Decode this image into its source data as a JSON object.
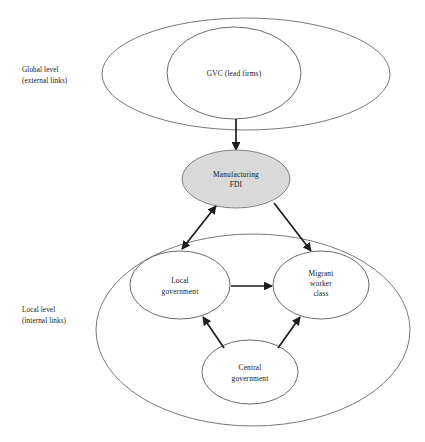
{
  "figure": {
    "type": "conceptual-diagram",
    "background_color": "#ffffff",
    "line_color": "#1d1d1d",
    "outline_color": "#6a6a6a",
    "highlight_fill": "#d9d9d9"
  },
  "levels": [
    {
      "id": "global",
      "label_line1": "Global level",
      "label_line2": "(external links)"
    },
    {
      "id": "local",
      "label_line1": "Local level",
      "label_line2": "(internal links)"
    }
  ],
  "nodes": {
    "gvc": {
      "line1": "GVC (lead firms)",
      "line2": ""
    },
    "manufacturing_fdi": {
      "line1": "Manufacturing",
      "line2": "FDI"
    },
    "local_government": {
      "line1": "Local",
      "line2": "government"
    },
    "migrant_worker": {
      "line1": "Migrant",
      "line2": "worker",
      "line3": "class"
    },
    "central_government": {
      "line1": "Central",
      "line2": "government"
    }
  },
  "connections": [
    {
      "from": "gvc",
      "to": "manufacturing_fdi",
      "style": "single-arrow",
      "direction": "down"
    },
    {
      "from": "manufacturing_fdi",
      "to": "local_government",
      "style": "double-arrow",
      "direction": "diagonal-down-left"
    },
    {
      "from": "manufacturing_fdi",
      "to": "migrant_worker",
      "style": "single-arrow",
      "direction": "diagonal-down-right"
    },
    {
      "from": "local_government",
      "to": "migrant_worker",
      "style": "single-arrow",
      "direction": "right"
    },
    {
      "from": "central_government",
      "to": "local_government",
      "style": "single-arrow",
      "direction": "diagonal-up-left"
    },
    {
      "from": "central_government",
      "to": "migrant_worker",
      "style": "single-arrow",
      "direction": "diagonal-up-right"
    }
  ]
}
